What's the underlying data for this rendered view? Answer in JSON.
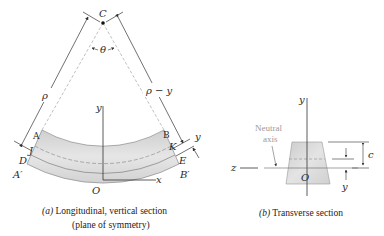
{
  "figure_a": {
    "center_label": "C",
    "angle_label": "θ",
    "radius_label": "ρ",
    "radius_minus_y_label": "ρ − y",
    "y_axis_label": "y",
    "x_axis_label": "x",
    "origin_label": "O",
    "points": {
      "A": "A",
      "B": "B",
      "J": "J",
      "K": "K",
      "D": "D",
      "E": "E",
      "A_prime": "A′",
      "B_prime": "B′"
    },
    "offset_label": "y",
    "caption_prefix": "(a)",
    "caption_line1": " Longitudinal, vertical section",
    "caption_line2": "(plane of symmetry)"
  },
  "figure_b": {
    "y_axis_label": "y",
    "z_axis_label": "z",
    "origin_label": "O",
    "neutral_axis_line1": "Neutral",
    "neutral_axis_line2": "axis",
    "c_label": "c",
    "y_dim_label": "y",
    "caption_prefix": "(b)",
    "caption_text": " Transverse section"
  },
  "colors": {
    "beam_fill": "#d9d9d9",
    "beam_edge": "#8a8a8a",
    "line": "#3a3a3a",
    "dashed": "#a8a8a8",
    "muted_text": "#9a9a9a"
  }
}
